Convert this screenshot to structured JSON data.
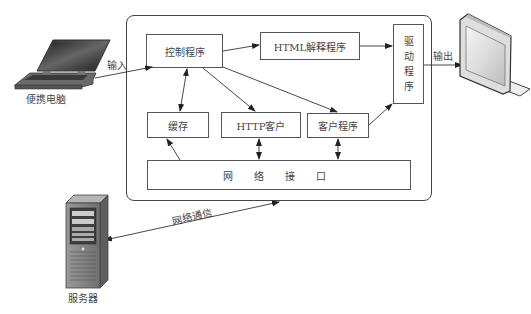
{
  "diagram": {
    "type": "browser-architecture",
    "nodes": {
      "control": {
        "label": "控制程序"
      },
      "html_parser": {
        "label": "HTML解释程序"
      },
      "driver": {
        "label": "驱动程序",
        "chars": [
          "驱",
          "动",
          "程",
          "序"
        ]
      },
      "cache": {
        "label": "缓存"
      },
      "http_client": {
        "label": "HTTP客户"
      },
      "client_program": {
        "label": "客户程序"
      },
      "network_interface": {
        "label": "网 络 接 口"
      }
    },
    "external": {
      "laptop": {
        "label": "便携电脑"
      },
      "monitor": {
        "label": ""
      },
      "server": {
        "label": "服务器"
      }
    },
    "edge_labels": {
      "input": "输入",
      "output": "输出",
      "network_comm": "网络通信"
    },
    "edges": [
      {
        "from": "laptop",
        "to": "control",
        "label": "输入"
      },
      {
        "from": "control",
        "to": "html_parser"
      },
      {
        "from": "html_parser",
        "to": "driver"
      },
      {
        "from": "control",
        "to": "cache",
        "bidirectional": true
      },
      {
        "from": "control",
        "to": "http_client"
      },
      {
        "from": "control",
        "to": "client_program"
      },
      {
        "from": "client_program",
        "to": "driver"
      },
      {
        "from": "http_client",
        "to": "network_interface",
        "bidirectional": true
      },
      {
        "from": "client_program",
        "to": "network_interface",
        "bidirectional": true
      },
      {
        "from": "network_interface",
        "to": "cache"
      },
      {
        "from": "driver",
        "to": "monitor",
        "label": "输出"
      },
      {
        "from": "server",
        "to": "container",
        "label": "网络通信",
        "bidirectional": true
      }
    ]
  }
}
